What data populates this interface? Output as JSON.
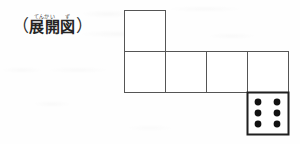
{
  "page": {
    "background_color": "#fefefe",
    "width": 300,
    "height": 144
  },
  "caption": {
    "open_paren": "（",
    "close_paren": "）",
    "ruby_segments": [
      {
        "ruby": "てんかい",
        "base": "展開"
      },
      {
        "ruby": "ず",
        "base": "図"
      }
    ],
    "full_text": "（展開図）",
    "reading": "てんかいず",
    "meaning_label": "展開図"
  },
  "figure": {
    "name": "cube-net",
    "square_size": 41,
    "stroke_color": "#555555",
    "stroke_width": 1,
    "emphasis_stroke_color": "#1f1f1f",
    "emphasis_stroke_width": 2,
    "dot_color": "#111111",
    "squares": [
      {
        "id": "top",
        "label": "",
        "x": 124,
        "y": 10,
        "w": 41,
        "h": 41,
        "emphasis": false,
        "pips": 0
      },
      {
        "id": "mid-1",
        "label": "",
        "x": 124,
        "y": 51,
        "w": 41,
        "h": 41,
        "emphasis": false,
        "pips": 0
      },
      {
        "id": "mid-2",
        "label": "",
        "x": 165,
        "y": 51,
        "w": 41,
        "h": 41,
        "emphasis": false,
        "pips": 0
      },
      {
        "id": "mid-3",
        "label": "",
        "x": 206,
        "y": 51,
        "w": 41,
        "h": 41,
        "emphasis": false,
        "pips": 0
      },
      {
        "id": "mid-4",
        "label": "",
        "x": 247,
        "y": 51,
        "w": 41,
        "h": 41,
        "emphasis": false,
        "pips": 0
      },
      {
        "id": "bottom",
        "label": "6",
        "x": 247,
        "y": 92,
        "w": 41,
        "h": 42,
        "emphasis": true,
        "pips": 6
      }
    ],
    "die_face": {
      "value": 6,
      "pip_count": 6,
      "pip_radius": 3.4,
      "arrangement": "2 columns x 3 rows",
      "pip_positions": [
        {
          "cx": 258,
          "cy": 102
        },
        {
          "cx": 277,
          "cy": 102
        },
        {
          "cx": 258,
          "cy": 113
        },
        {
          "cx": 277,
          "cy": 113
        },
        {
          "cx": 258,
          "cy": 124
        },
        {
          "cx": 277,
          "cy": 124
        }
      ]
    }
  }
}
